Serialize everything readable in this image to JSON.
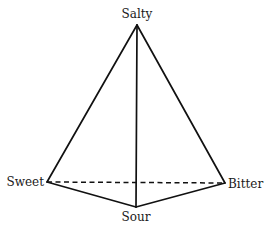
{
  "diagram": {
    "type": "taste-tetrahedron",
    "vertices": {
      "salty": {
        "label": "Salty",
        "x": 137,
        "y": 25
      },
      "sweet": {
        "label": "Sweet",
        "x": 47,
        "y": 182
      },
      "bitter": {
        "label": "Bitter",
        "x": 225,
        "y": 183
      },
      "sour": {
        "label": "Sour",
        "x": 136,
        "y": 207
      }
    },
    "edges": [
      {
        "from": "salty",
        "to": "sweet",
        "style": "solid"
      },
      {
        "from": "salty",
        "to": "bitter",
        "style": "solid"
      },
      {
        "from": "salty",
        "to": "sour",
        "style": "solid"
      },
      {
        "from": "sweet",
        "to": "sour",
        "style": "solid"
      },
      {
        "from": "sour",
        "to": "bitter",
        "style": "solid"
      },
      {
        "from": "sweet",
        "to": "bitter",
        "style": "dashed"
      }
    ],
    "colors": {
      "line": "#111111",
      "text": "#1a1a1a",
      "background": "#ffffff"
    }
  }
}
